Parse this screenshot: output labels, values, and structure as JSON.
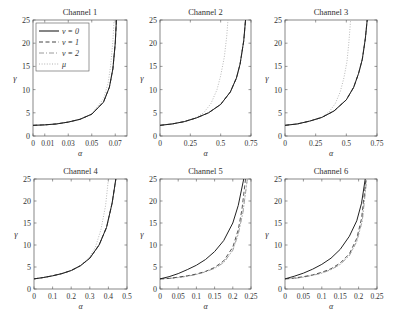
{
  "figure": {
    "legend": {
      "entries": [
        {
          "label": "ν = 0",
          "style": "solid"
        },
        {
          "label": "ν = 1",
          "style": "dashed"
        },
        {
          "label": "ν = 2",
          "style": "dashdot"
        },
        {
          "label": "μ",
          "style": "dotted"
        }
      ]
    }
  },
  "chart_data": [
    {
      "type": "line",
      "title": "Channel 1",
      "xlabel": "α",
      "ylabel": "γ",
      "xlim": [
        0,
        0.08
      ],
      "ylim": [
        0,
        25
      ],
      "xticks": [
        0,
        0.01,
        0.03,
        0.05,
        0.07
      ],
      "xtick_labels": [
        "0",
        "0.01",
        "0.03",
        "0.05",
        "0.07"
      ],
      "yticks": [
        0,
        5,
        10,
        15,
        20,
        25
      ],
      "legend_position": "upper left",
      "series": [
        {
          "name": "ν = 0",
          "x": [
            0,
            0.01,
            0.02,
            0.03,
            0.04,
            0.05,
            0.06,
            0.065,
            0.068,
            0.07,
            0.071
          ],
          "y": [
            2.3,
            2.4,
            2.6,
            3.0,
            3.6,
            4.7,
            7.3,
            10.5,
            14.5,
            20.0,
            25.0
          ]
        },
        {
          "name": "ν = 1",
          "x": [
            0,
            0.01,
            0.02,
            0.03,
            0.04,
            0.05,
            0.06,
            0.065,
            0.068,
            0.07,
            0.071
          ],
          "y": [
            2.3,
            2.4,
            2.6,
            3.0,
            3.6,
            4.7,
            7.3,
            10.5,
            14.5,
            20.0,
            25.0
          ]
        },
        {
          "name": "ν = 2",
          "x": [
            0,
            0.01,
            0.02,
            0.03,
            0.04,
            0.05,
            0.06,
            0.065,
            0.068,
            0.07,
            0.071
          ],
          "y": [
            2.3,
            2.4,
            2.6,
            3.0,
            3.6,
            4.7,
            7.3,
            10.5,
            14.5,
            20.0,
            25.0
          ]
        },
        {
          "name": "μ",
          "x": [
            0,
            0.01,
            0.02,
            0.03,
            0.04,
            0.05,
            0.06,
            0.064,
            0.066,
            0.068,
            0.069
          ],
          "y": [
            2.3,
            2.4,
            2.6,
            3.0,
            3.6,
            4.8,
            8.0,
            11.5,
            15.0,
            20.5,
            25.0
          ]
        }
      ]
    },
    {
      "type": "line",
      "title": "Channel 2",
      "xlabel": "α",
      "ylabel": "γ",
      "xlim": [
        0,
        0.75
      ],
      "ylim": [
        0,
        25
      ],
      "xticks": [
        0,
        0.25,
        0.5,
        0.75
      ],
      "xtick_labels": [
        "0",
        "0.25",
        "0.5",
        "0.75"
      ],
      "yticks": [
        0,
        5,
        10,
        15,
        20,
        25
      ],
      "series": [
        {
          "name": "ν = 0",
          "x": [
            0,
            0.1,
            0.2,
            0.3,
            0.4,
            0.5,
            0.58,
            0.63,
            0.66,
            0.69,
            0.705
          ],
          "y": [
            2.3,
            2.6,
            3.1,
            3.9,
            5.0,
            6.8,
            9.5,
            12.5,
            15.5,
            20.5,
            25.0
          ]
        },
        {
          "name": "ν = 1",
          "x": [
            0,
            0.1,
            0.2,
            0.3,
            0.4,
            0.5,
            0.58,
            0.63,
            0.66,
            0.69,
            0.705
          ],
          "y": [
            2.3,
            2.6,
            3.1,
            3.9,
            5.0,
            6.8,
            9.5,
            12.5,
            15.5,
            20.5,
            25.0
          ]
        },
        {
          "name": "ν = 2",
          "x": [
            0,
            0.1,
            0.2,
            0.3,
            0.4,
            0.5,
            0.58,
            0.63,
            0.66,
            0.69,
            0.705
          ],
          "y": [
            2.3,
            2.6,
            3.1,
            3.9,
            5.0,
            6.8,
            9.5,
            12.5,
            15.5,
            20.5,
            25.0
          ]
        },
        {
          "name": "μ",
          "x": [
            0,
            0.1,
            0.2,
            0.3,
            0.36,
            0.42,
            0.47,
            0.5,
            0.53,
            0.55,
            0.56
          ],
          "y": [
            2.3,
            2.6,
            3.1,
            4.0,
            5.0,
            7.0,
            10.0,
            13.0,
            17.0,
            21.5,
            25.0
          ]
        }
      ]
    },
    {
      "type": "line",
      "title": "Channel 3",
      "xlabel": "α",
      "ylabel": "γ",
      "xlim": [
        0,
        0.75
      ],
      "ylim": [
        0,
        25
      ],
      "xticks": [
        0,
        0.25,
        0.5,
        0.75
      ],
      "xtick_labels": [
        "0",
        "0.25",
        "0.5",
        "0.75"
      ],
      "yticks": [
        0,
        5,
        10,
        15,
        20,
        25
      ],
      "series": [
        {
          "name": "ν = 0",
          "x": [
            0,
            0.1,
            0.2,
            0.3,
            0.4,
            0.5,
            0.56,
            0.6,
            0.63,
            0.655,
            0.67
          ],
          "y": [
            2.3,
            2.6,
            3.2,
            4.0,
            5.4,
            7.8,
            10.5,
            13.5,
            16.5,
            21.0,
            25.0
          ]
        },
        {
          "name": "ν = 1",
          "x": [
            0,
            0.1,
            0.2,
            0.3,
            0.4,
            0.5,
            0.56,
            0.6,
            0.63,
            0.655,
            0.67
          ],
          "y": [
            2.3,
            2.6,
            3.2,
            4.0,
            5.4,
            7.8,
            10.5,
            13.5,
            16.5,
            21.0,
            25.0
          ]
        },
        {
          "name": "ν = 2",
          "x": [
            0,
            0.1,
            0.2,
            0.3,
            0.4,
            0.5,
            0.56,
            0.6,
            0.63,
            0.655,
            0.67
          ],
          "y": [
            2.3,
            2.6,
            3.2,
            4.0,
            5.4,
            7.8,
            10.5,
            13.5,
            16.5,
            21.0,
            25.0
          ]
        },
        {
          "name": "μ",
          "x": [
            0,
            0.1,
            0.2,
            0.3,
            0.36,
            0.41,
            0.45,
            0.48,
            0.505,
            0.52,
            0.535
          ],
          "y": [
            2.3,
            2.6,
            3.2,
            4.1,
            5.2,
            7.0,
            9.5,
            12.5,
            16.0,
            20.0,
            25.0
          ]
        }
      ]
    },
    {
      "type": "line",
      "title": "Channel 4",
      "xlabel": "α",
      "ylabel": "γ",
      "xlim": [
        0,
        0.5
      ],
      "ylim": [
        0,
        25
      ],
      "xticks": [
        0,
        0.1,
        0.2,
        0.3,
        0.4,
        0.5
      ],
      "xtick_labels": [
        "0",
        "0.1",
        "0.2",
        "0.3",
        "0.4",
        "0.5"
      ],
      "yticks": [
        0,
        5,
        10,
        15,
        20,
        25
      ],
      "series": [
        {
          "name": "ν = 0",
          "x": [
            0,
            0.05,
            0.1,
            0.15,
            0.2,
            0.25,
            0.3,
            0.35,
            0.39,
            0.42,
            0.44
          ],
          "y": [
            2.3,
            2.6,
            3.0,
            3.5,
            4.2,
            5.3,
            7.0,
            10.0,
            14.0,
            19.5,
            25.0
          ]
        },
        {
          "name": "ν = 1",
          "x": [
            0,
            0.05,
            0.1,
            0.15,
            0.2,
            0.25,
            0.3,
            0.35,
            0.39,
            0.42,
            0.44
          ],
          "y": [
            2.3,
            2.6,
            3.0,
            3.5,
            4.2,
            5.3,
            7.0,
            10.0,
            14.0,
            19.5,
            25.0
          ]
        },
        {
          "name": "ν = 2",
          "x": [
            0,
            0.05,
            0.1,
            0.15,
            0.2,
            0.25,
            0.3,
            0.35,
            0.39,
            0.42,
            0.44
          ],
          "y": [
            2.3,
            2.6,
            3.0,
            3.5,
            4.2,
            5.3,
            7.0,
            10.0,
            14.0,
            19.5,
            25.0
          ]
        },
        {
          "name": "μ",
          "x": [
            0,
            0.05,
            0.1,
            0.15,
            0.2,
            0.25,
            0.3,
            0.33,
            0.36,
            0.385,
            0.4
          ],
          "y": [
            2.3,
            2.6,
            3.0,
            3.5,
            4.2,
            5.3,
            7.3,
            9.5,
            13.5,
            19.0,
            25.0
          ]
        }
      ]
    },
    {
      "type": "line",
      "title": "Channel 5",
      "xlabel": "α",
      "ylabel": "γ",
      "xlim": [
        0,
        0.25
      ],
      "ylim": [
        0,
        25
      ],
      "xticks": [
        0,
        0.05,
        0.1,
        0.15,
        0.2,
        0.25
      ],
      "xtick_labels": [
        "0",
        "0.05",
        "0.1",
        "0.15",
        "0.2",
        "0.25"
      ],
      "yticks": [
        0,
        5,
        10,
        15,
        20,
        25
      ],
      "series": [
        {
          "name": "ν = 0",
          "x": [
            0,
            0.025,
            0.05,
            0.075,
            0.1,
            0.125,
            0.15,
            0.175,
            0.2,
            0.215,
            0.23
          ],
          "y": [
            2.3,
            2.8,
            3.5,
            4.4,
            5.4,
            6.7,
            8.5,
            11.0,
            15.0,
            19.0,
            25.0
          ]
        },
        {
          "name": "ν = 1",
          "x": [
            0,
            0.025,
            0.05,
            0.075,
            0.1,
            0.125,
            0.15,
            0.175,
            0.2,
            0.215,
            0.225,
            0.235
          ],
          "y": [
            2.3,
            2.4,
            2.7,
            3.0,
            3.4,
            4.0,
            4.9,
            6.4,
            9.5,
            13.5,
            18.0,
            25.0
          ]
        },
        {
          "name": "ν = 2",
          "x": [
            0,
            0.025,
            0.05,
            0.075,
            0.1,
            0.125,
            0.15,
            0.175,
            0.2,
            0.215,
            0.228,
            0.24
          ],
          "y": [
            2.3,
            2.4,
            2.6,
            2.9,
            3.3,
            3.9,
            4.7,
            6.0,
            8.8,
            12.5,
            17.5,
            25.0
          ]
        },
        {
          "name": "μ",
          "x": [
            0,
            0.025,
            0.05,
            0.075,
            0.1,
            0.125,
            0.15,
            0.175,
            0.2,
            0.215,
            0.228,
            0.24
          ],
          "y": [
            2.3,
            2.4,
            2.6,
            2.9,
            3.3,
            3.9,
            4.7,
            6.0,
            8.8,
            12.5,
            17.5,
            25.0
          ]
        }
      ]
    },
    {
      "type": "line",
      "title": "Channel 6",
      "xlabel": "α",
      "ylabel": "γ",
      "xlim": [
        0,
        0.25
      ],
      "ylim": [
        0,
        25
      ],
      "xticks": [
        0,
        0.05,
        0.1,
        0.15,
        0.2,
        0.25
      ],
      "xtick_labels": [
        "0",
        "0.05",
        "0.1",
        "0.15",
        "0.2",
        "0.25"
      ],
      "yticks": [
        0,
        5,
        10,
        15,
        20,
        25
      ],
      "series": [
        {
          "name": "ν = 0",
          "x": [
            0,
            0.025,
            0.05,
            0.075,
            0.1,
            0.125,
            0.15,
            0.175,
            0.195,
            0.208,
            0.218
          ],
          "y": [
            2.3,
            2.9,
            3.6,
            4.5,
            5.6,
            7.0,
            9.0,
            12.0,
            15.5,
            19.5,
            25.0
          ]
        },
        {
          "name": "ν = 1",
          "x": [
            0,
            0.025,
            0.05,
            0.075,
            0.1,
            0.125,
            0.15,
            0.175,
            0.195,
            0.208,
            0.22
          ],
          "y": [
            2.3,
            2.5,
            2.8,
            3.2,
            3.8,
            4.6,
            5.9,
            8.0,
            11.5,
            16.0,
            25.0
          ]
        },
        {
          "name": "ν = 2",
          "x": [
            0,
            0.025,
            0.05,
            0.075,
            0.1,
            0.125,
            0.15,
            0.175,
            0.195,
            0.21,
            0.222
          ],
          "y": [
            2.3,
            2.4,
            2.7,
            3.1,
            3.6,
            4.4,
            5.6,
            7.6,
            10.8,
            15.5,
            25.0
          ]
        },
        {
          "name": "μ",
          "x": [
            0,
            0.025,
            0.05,
            0.075,
            0.1,
            0.125,
            0.15,
            0.175,
            0.195,
            0.21,
            0.222
          ],
          "y": [
            2.3,
            2.4,
            2.7,
            3.1,
            3.6,
            4.4,
            5.6,
            7.6,
            10.8,
            15.5,
            25.0
          ]
        }
      ]
    }
  ]
}
